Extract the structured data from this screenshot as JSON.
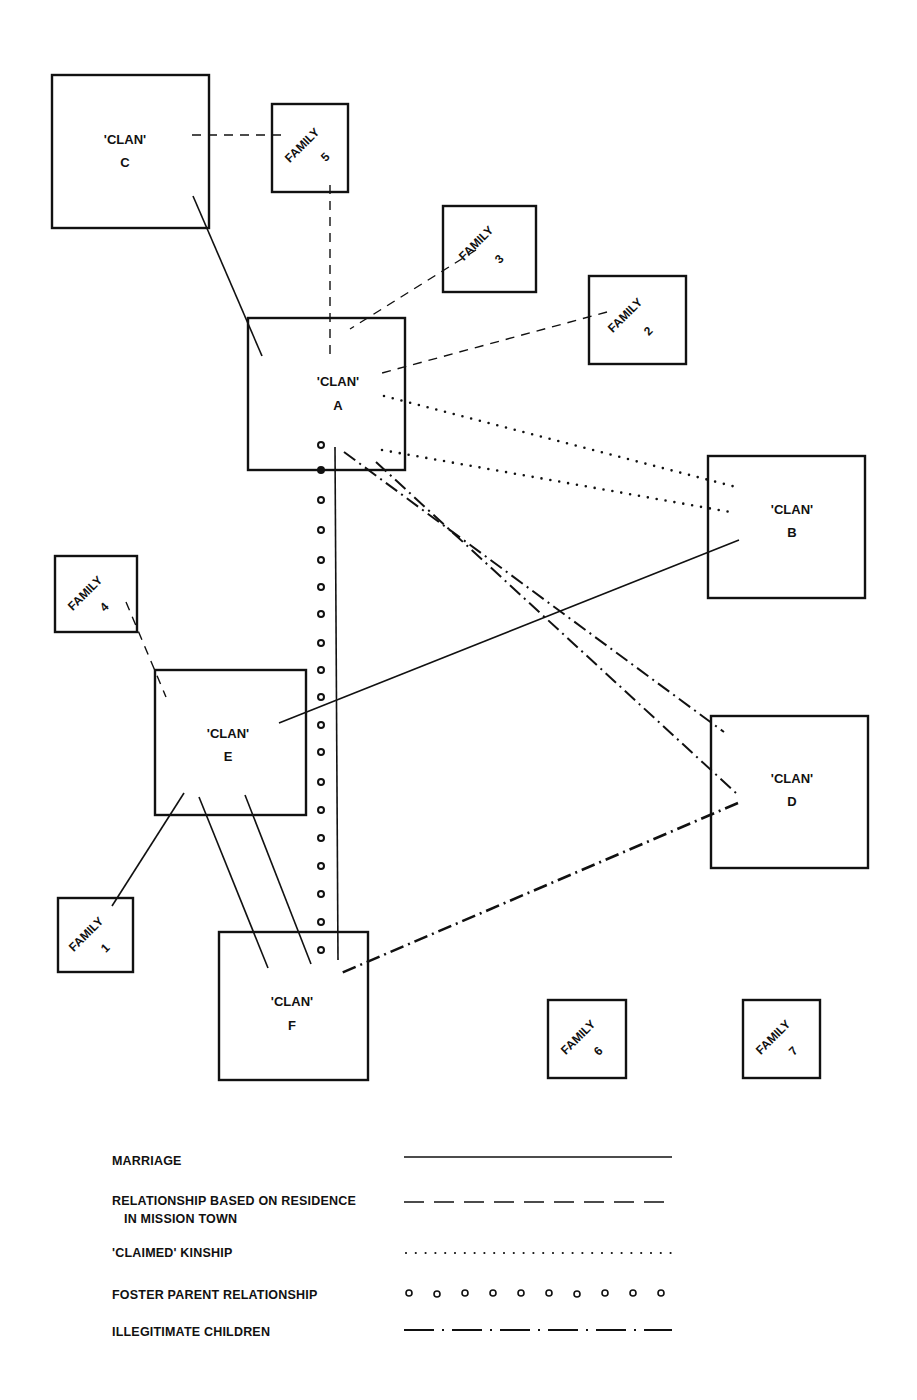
{
  "diagram": {
    "clans": [
      {
        "id": "C",
        "label": "'CLAN'",
        "letter": "C"
      },
      {
        "id": "A",
        "label": "'CLAN'",
        "letter": "A"
      },
      {
        "id": "B",
        "label": "'CLAN'",
        "letter": "B"
      },
      {
        "id": "E",
        "label": "'CLAN'",
        "letter": "E"
      },
      {
        "id": "D",
        "label": "'CLAN'",
        "letter": "D"
      },
      {
        "id": "F",
        "label": "'CLAN'",
        "letter": "F"
      }
    ],
    "families": [
      {
        "id": "5",
        "label": "FAMILY",
        "number": "5"
      },
      {
        "id": "3",
        "label": "FAMILY",
        "number": "3"
      },
      {
        "id": "2",
        "label": "FAMILY",
        "number": "2"
      },
      {
        "id": "4",
        "label": "FAMILY",
        "number": "4"
      },
      {
        "id": "1",
        "label": "FAMILY",
        "number": "1"
      },
      {
        "id": "6",
        "label": "FAMILY",
        "number": "6"
      },
      {
        "id": "7",
        "label": "FAMILY",
        "number": "7"
      }
    ],
    "relationships": [
      {
        "type": "marriage",
        "from": "C",
        "to": "A"
      },
      {
        "type": "marriage",
        "from": "A",
        "to": "F"
      },
      {
        "type": "marriage",
        "from": "B",
        "to": "E"
      },
      {
        "type": "marriage",
        "from": "E",
        "to": "Family 1"
      },
      {
        "type": "marriage",
        "from": "E",
        "to": "F"
      },
      {
        "type": "marriage",
        "from": "E",
        "to": "F"
      },
      {
        "type": "residence",
        "from": "C",
        "to": "Family 5"
      },
      {
        "type": "residence",
        "from": "Family 5",
        "to": "A"
      },
      {
        "type": "residence",
        "from": "Family 3",
        "to": "A"
      },
      {
        "type": "residence",
        "from": "Family 2",
        "to": "A"
      },
      {
        "type": "residence",
        "from": "Family 4",
        "to": "E"
      },
      {
        "type": "claimed",
        "from": "A",
        "to": "B"
      },
      {
        "type": "claimed",
        "from": "A",
        "to": "B"
      },
      {
        "type": "foster",
        "from": "A",
        "to": "F"
      },
      {
        "type": "illegitimate",
        "from": "A",
        "to": "D"
      },
      {
        "type": "illegitimate",
        "from": "A",
        "to": "D"
      },
      {
        "type": "illegitimate",
        "from": "D",
        "to": "F"
      }
    ]
  },
  "legend": {
    "items": [
      {
        "label": "MARRIAGE",
        "style": "solid"
      },
      {
        "label": "RELATIONSHIP BASED ON RESIDENCE",
        "label2": "IN MISSION TOWN",
        "style": "dashed"
      },
      {
        "label": "'CLAIMED'  KINSHIP",
        "style": "dotted"
      },
      {
        "label": "FOSTER PARENT RELATIONSHIP",
        "style": "circles"
      },
      {
        "label": "ILLEGITIMATE CHILDREN",
        "style": "dash-dot"
      }
    ]
  }
}
